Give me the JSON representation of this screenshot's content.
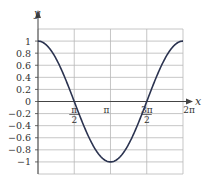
{
  "chart_data": {
    "type": "line",
    "title": "",
    "function": "cos(x)",
    "xlabel": "x",
    "ylabel": "y",
    "xlim": [
      0,
      6.2832
    ],
    "ylim": [
      -1.2,
      1.2
    ],
    "grid": true,
    "x_ticks": [
      {
        "value": 1.5708,
        "label_num": "π",
        "label_den": "2"
      },
      {
        "value": 3.1416,
        "label": "π"
      },
      {
        "value": 4.7124,
        "label_num": "3π",
        "label_den": "2"
      },
      {
        "value": 6.2832,
        "label": "2π"
      }
    ],
    "y_ticks": [
      "1",
      "0.8",
      "0.6",
      "0.4",
      "0.2",
      "0",
      "−0.2",
      "−0.4",
      "−0.6",
      "−0.8",
      "−1"
    ],
    "y_tick_values": [
      1,
      0.8,
      0.6,
      0.4,
      0.2,
      0,
      -0.2,
      -0.4,
      -0.6,
      -0.8,
      -1
    ],
    "series": [
      {
        "name": "y = cos x",
        "x": [
          0,
          0.7854,
          1.5708,
          2.3562,
          3.1416,
          3.927,
          4.7124,
          5.4978,
          6.2832
        ],
        "y": [
          1,
          0.707,
          0,
          -0.707,
          -1,
          -0.707,
          0,
          0.707,
          1
        ]
      }
    ],
    "colors": {
      "curve": "#2b3350",
      "grid": "#b8b8b8",
      "axis": "#444444"
    }
  }
}
